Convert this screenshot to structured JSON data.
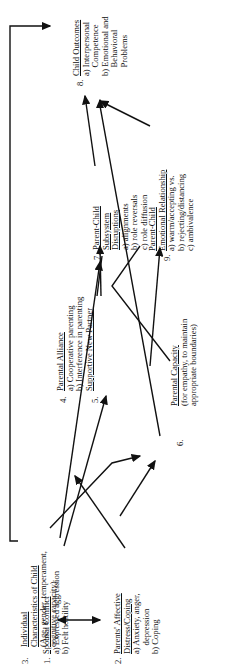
{
  "diagram": {
    "nodes": [
      {
        "id": 1,
        "number": "1.",
        "title_lines": [
          "Spousal Conflict"
        ],
        "items": [
          "a) Expressed aggression",
          "b) Felt hostility"
        ]
      },
      {
        "id": 2,
        "number": "2.",
        "title_lines": [
          "Parents' Affective",
          "Distress/Coping"
        ],
        "items": [
          "a) Anxiety, anger,",
          "    depression",
          "b) Coping"
        ]
      },
      {
        "id": 3,
        "number": "3.",
        "title_lines": [
          "Individual",
          "Characteristics of Child"
        ],
        "items": [
          "(Age, gender, temperament,",
          "cognitive capacity)"
        ]
      },
      {
        "id": 4,
        "number": "4.",
        "title_lines": [
          "Parental Alliance"
        ],
        "items": [
          "a) Cooperative parenting",
          "b) Interference in parenting"
        ]
      },
      {
        "id": 5,
        "number": "5.",
        "title_lines": [
          "Supportive New Partner"
        ],
        "items": []
      },
      {
        "id": 6,
        "number": "6.",
        "title_lines": [
          "Parental Capacity"
        ],
        "items": [
          "(for empathy, to maintain",
          "appropriate boundaries)"
        ]
      },
      {
        "id": 7,
        "number": "7.",
        "title_lines": [
          "Parent-Child",
          "Subsystem",
          "Disruptions"
        ],
        "items": [
          "a) alignments",
          "b) role reversals",
          "c) role diffusion"
        ]
      },
      {
        "id": 8,
        "number": "8.",
        "title_lines": [
          "Child Outcomes"
        ],
        "items": [
          "a) Interpersonal",
          "    Competence",
          "b) Emotional and",
          "    Behavioral",
          "    Problems"
        ]
      },
      {
        "id": 9,
        "number": "9.",
        "title_lines": [
          "Parent-Child",
          "Emotional Relationship"
        ],
        "items": [
          "a) warm/accepting vs.",
          "b) rejecting/distancing",
          "c) ambivalence"
        ]
      }
    ],
    "edges": [
      {
        "from": 1,
        "to": 2,
        "type": "bidirectional"
      },
      {
        "from": 1,
        "to": 4
      },
      {
        "from": 1,
        "to": 6
      },
      {
        "from": 2,
        "to": 5
      },
      {
        "from": 2,
        "to": 6
      },
      {
        "from": 3,
        "to": 8
      },
      {
        "from": 3,
        "to": 7
      },
      {
        "from": 4,
        "to": 7
      },
      {
        "from": 4,
        "to": 9
      },
      {
        "from": 5,
        "to": 7
      },
      {
        "from": 6,
        "to": 9
      },
      {
        "from": 6,
        "to": 8
      },
      {
        "from": 7,
        "to": 8
      },
      {
        "from": 9,
        "to": 8
      }
    ]
  }
}
